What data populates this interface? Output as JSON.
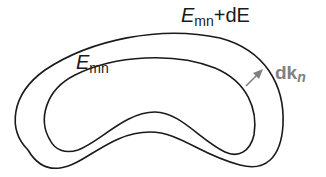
{
  "diagram": {
    "outer_label": {
      "symbol": "E",
      "subscript": "mn",
      "suffix": "+dE"
    },
    "inner_label": {
      "symbol": "E",
      "subscript": "mn"
    },
    "arrow_label": {
      "symbol": "dk",
      "subscript": "n"
    },
    "colors": {
      "curve": "#1a1a1a",
      "arrow": "#808080",
      "text": "#1a1a1a"
    }
  }
}
